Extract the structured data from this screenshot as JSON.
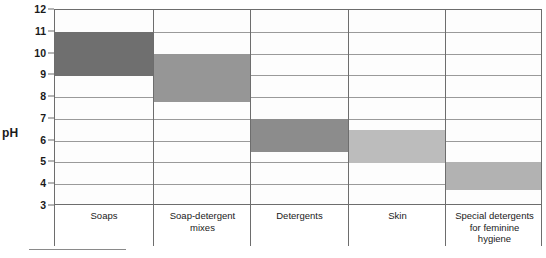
{
  "chart_data": {
    "type": "bar",
    "orientation": "vertical-range",
    "title": "",
    "subtitle": "",
    "xlabel": "",
    "ylabel": "pH",
    "ylim": [
      3,
      12
    ],
    "ytick_step": 1,
    "yticks": [
      12,
      11,
      10,
      9,
      8,
      7,
      6,
      5,
      4,
      3
    ],
    "grid": true,
    "legend": "none",
    "categories": [
      "Soaps",
      "Soap-detergent\nmixes",
      "Detergents",
      "Skin",
      "Special detergents\nfor feminine\nhygiene"
    ],
    "series": [
      {
        "name": "pH range",
        "ranges": [
          {
            "category": "Soaps",
            "low": 9.0,
            "high": 11.0,
            "color": "#6f6f6f"
          },
          {
            "category": "Soap-detergent mixes",
            "low": 7.8,
            "high": 10.0,
            "color": "#969696"
          },
          {
            "category": "Detergents",
            "low": 5.5,
            "high": 7.0,
            "color": "#8c8c8c"
          },
          {
            "category": "Skin",
            "low": 5.0,
            "high": 6.5,
            "color": "#bcbcbc"
          },
          {
            "category": "Special detergents for feminine hygiene",
            "low": 3.7,
            "high": 5.0,
            "color": "#b2b2b2"
          }
        ]
      }
    ],
    "annotations": []
  },
  "axis": {
    "y_title": "pH"
  },
  "colors": {
    "axis_line": "#6d6d6d",
    "gridline": "#9a9a9a",
    "plot_background": "#fdfdfd",
    "text": "#1a1a1a"
  }
}
